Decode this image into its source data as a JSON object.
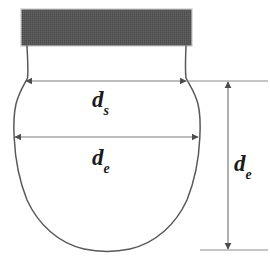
{
  "figure": {
    "type": "technical-diagram",
    "background_color": "#ffffff",
    "outline_color": "#595959",
    "dimension_line_color": "#808080",
    "plate_color": "#555555",
    "label_color": "#1a1a1a"
  },
  "plate": {
    "name": "needle-support-plate",
    "fill": "#555555",
    "texture": "dithered-hatch",
    "border_color": "#cccccc"
  },
  "drop": {
    "name": "pendant-drop-outline",
    "stroke": "#595959",
    "fill": "none"
  },
  "dimensions": [
    {
      "id": "ds",
      "base": "d",
      "subscript": "s",
      "orientation": "horizontal",
      "meaning": "drop diameter at distance d_e from apex",
      "arrow_style": "double-headed"
    },
    {
      "id": "de_horizontal",
      "base": "d",
      "subscript": "e",
      "orientation": "horizontal",
      "meaning": "equatorial (maximum) drop diameter",
      "arrow_style": "double-headed"
    },
    {
      "id": "de_vertical",
      "base": "d",
      "subscript": "e",
      "orientation": "vertical",
      "meaning": "vertical offset equal to equatorial diameter",
      "arrow_style": "double-headed"
    }
  ]
}
